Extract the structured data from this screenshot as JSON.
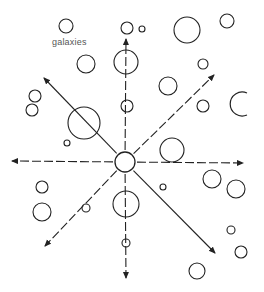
{
  "diagram": {
    "title": "",
    "label": "galaxies",
    "colors": {
      "stroke": "#222222",
      "background": "#ffffff",
      "label": "#555555"
    },
    "center": {
      "x": 125,
      "y": 162,
      "r": 10
    },
    "arrows": [
      {
        "name": "up",
        "x2": 126,
        "y2": 39,
        "style": "dashed"
      },
      {
        "name": "down",
        "x2": 126,
        "y2": 278,
        "style": "dashed"
      },
      {
        "name": "left",
        "x2": 12,
        "y2": 161,
        "style": "dashed"
      },
      {
        "name": "right",
        "x2": 243,
        "y2": 163,
        "style": "dashed"
      },
      {
        "name": "up-left",
        "x2": 44,
        "y2": 78,
        "style": "solid"
      },
      {
        "name": "up-right",
        "x2": 214,
        "y2": 75,
        "style": "dashed"
      },
      {
        "name": "down-left",
        "x2": 45,
        "y2": 246,
        "style": "dashed"
      },
      {
        "name": "down-right",
        "x2": 215,
        "y2": 253,
        "style": "solid"
      }
    ],
    "galaxies": [
      {
        "x": 66,
        "y": 26,
        "r": 7
      },
      {
        "x": 127,
        "y": 28,
        "r": 6
      },
      {
        "x": 142,
        "y": 29,
        "r": 3
      },
      {
        "x": 187,
        "y": 30,
        "r": 13
      },
      {
        "x": 227,
        "y": 21,
        "r": 7
      },
      {
        "x": 86,
        "y": 64,
        "r": 9
      },
      {
        "x": 126,
        "y": 62,
        "r": 12
      },
      {
        "x": 203,
        "y": 64,
        "r": 5
      },
      {
        "x": 168,
        "y": 86,
        "r": 9
      },
      {
        "x": 35,
        "y": 96,
        "r": 6
      },
      {
        "x": 32,
        "y": 110,
        "r": 6
      },
      {
        "x": 84,
        "y": 123,
        "r": 16
      },
      {
        "x": 127,
        "y": 106,
        "r": 6
      },
      {
        "x": 203,
        "y": 106,
        "r": 6
      },
      {
        "x": 67,
        "y": 143,
        "r": 3
      },
      {
        "x": 172,
        "y": 150,
        "r": 12
      },
      {
        "x": 212,
        "y": 179,
        "r": 9
      },
      {
        "x": 236,
        "y": 189,
        "r": 9
      },
      {
        "x": 42,
        "y": 187,
        "r": 6
      },
      {
        "x": 42,
        "y": 212,
        "r": 9
      },
      {
        "x": 86,
        "y": 208,
        "r": 4
      },
      {
        "x": 126,
        "y": 204,
        "r": 13
      },
      {
        "x": 163,
        "y": 187,
        "r": 3
      },
      {
        "x": 126,
        "y": 243,
        "r": 4
      },
      {
        "x": 231,
        "y": 230,
        "r": 4
      },
      {
        "x": 241,
        "y": 252,
        "r": 6
      },
      {
        "x": 197,
        "y": 271,
        "r": 8
      },
      {
        "x": 222,
        "y": 218,
        "r": 0
      }
    ],
    "partial_arc": {
      "x": 245,
      "y": 104,
      "r": 12
    }
  }
}
